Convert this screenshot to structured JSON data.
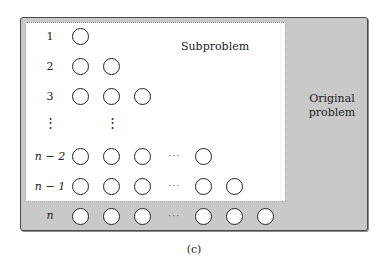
{
  "diagram": {
    "outer_region": {
      "label_line1": "Original",
      "label_line2": "problem",
      "fill_color": "#c9c9c9"
    },
    "inner_region": {
      "label": "Subproblem",
      "fill_color": "#ffffff"
    },
    "rows": [
      {
        "label": "1",
        "circles": 1
      },
      {
        "label": "2",
        "circles": 2
      },
      {
        "label": "3",
        "circles": 3
      },
      {
        "label": "⋮",
        "circles": 0,
        "ellipsis": "⋮"
      },
      {
        "label": "n − 2",
        "circles": "3 … 1",
        "ellipsis": "···"
      },
      {
        "label": "n − 1",
        "circles": "3 … 2",
        "ellipsis": "···"
      },
      {
        "label": "n",
        "circles": "3 … 3",
        "ellipsis": "···"
      }
    ],
    "row_labels": {
      "r1": "1",
      "r2": "2",
      "r3": "3",
      "rdots": "⋮",
      "rn2": "n − 2",
      "rn1": "n − 1",
      "rn": "n"
    },
    "ellipsis_h": "···",
    "caption": "(c)"
  }
}
